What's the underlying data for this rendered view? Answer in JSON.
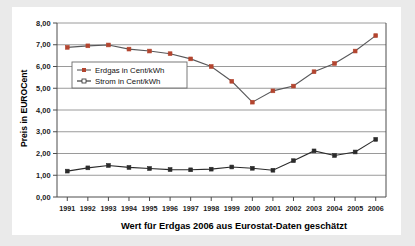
{
  "chart_data": {
    "type": "line",
    "title": "",
    "xlabel": "Wert für Erdgas 2006 aus Eurostat-Daten geschätzt",
    "ylabel": "Preis in EUROCent",
    "categories": [
      "1991",
      "1992",
      "1993",
      "1994",
      "1995",
      "1996",
      "1997",
      "1998",
      "1999",
      "2000",
      "2001",
      "2002",
      "2003",
      "2004",
      "2005",
      "2006"
    ],
    "x": [
      1991,
      1992,
      1993,
      1994,
      1995,
      1996,
      1997,
      1998,
      1999,
      2000,
      2001,
      2002,
      2003,
      2004,
      2005,
      2006
    ],
    "xlim": [
      1990.5,
      2006.5
    ],
    "ylim": [
      0,
      8
    ],
    "ytick_labels": [
      "0,00",
      "1,00",
      "2,00",
      "3,00",
      "4,00",
      "5,00",
      "6,00",
      "7,00",
      "8,00"
    ],
    "ytick_values": [
      0,
      1,
      2,
      3,
      4,
      5,
      6,
      7,
      8
    ],
    "grid": true,
    "legend_position": "upper-left-inside",
    "series": [
      {
        "name": "Erdgas in Cent/kWh",
        "color": "#b3452f",
        "line_color": "#58585a",
        "marker": "square",
        "values": [
          6.88,
          6.95,
          6.99,
          6.8,
          6.71,
          6.59,
          6.35,
          6.0,
          5.32,
          4.36,
          4.88,
          5.1,
          5.76,
          6.14,
          6.71,
          7.42
        ]
      },
      {
        "name": "Strom in Cent/kWh",
        "color": "#2b2b2b",
        "line_color": "#2b2b2b",
        "marker": "square",
        "values": [
          1.19,
          1.34,
          1.45,
          1.36,
          1.31,
          1.26,
          1.25,
          1.28,
          1.38,
          1.32,
          1.23,
          1.67,
          2.12,
          1.91,
          2.07,
          2.65
        ]
      }
    ]
  },
  "legend": {
    "items": [
      {
        "label": "Erdgas in Cent/kWh"
      },
      {
        "label": "Strom in Cent/kWh"
      }
    ]
  },
  "colors": {
    "gas_marker": "#b3452f",
    "gas_line": "#58585a",
    "strom": "#2b2b2b",
    "grid": "#9a9a9a",
    "axis": "#4d4d4d",
    "page_background": "#eaeaea",
    "card_background": "#ffffff"
  }
}
